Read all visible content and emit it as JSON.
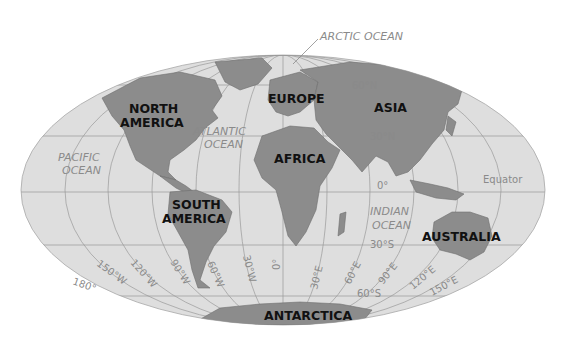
{
  "map": {
    "projection": "Mollweide (elliptical world map)",
    "colors": {
      "ocean": "#dedede",
      "land": "#8c8c8c",
      "border": "#9a9a9a",
      "label": "#111111",
      "secondary_label": "#8a8a8a"
    },
    "continents": [
      {
        "id": "north-america",
        "lines": [
          "NORTH",
          "AMERICA"
        ]
      },
      {
        "id": "south-america",
        "lines": [
          "SOUTH",
          "AMERICA"
        ]
      },
      {
        "id": "europe",
        "lines": [
          "EUROPE"
        ]
      },
      {
        "id": "africa",
        "lines": [
          "AFRICA"
        ]
      },
      {
        "id": "asia",
        "lines": [
          "ASIA"
        ]
      },
      {
        "id": "australia",
        "lines": [
          "AUSTRALIA"
        ]
      },
      {
        "id": "antarctica",
        "lines": [
          "ANTARCTICA"
        ]
      }
    ],
    "oceans": [
      {
        "id": "arctic",
        "lines": [
          "ARCTIC OCEAN"
        ]
      },
      {
        "id": "atlantic",
        "lines": [
          "ATLANTIC",
          "OCEAN"
        ]
      },
      {
        "id": "pacific",
        "lines": [
          "PACIFIC",
          "OCEAN"
        ]
      },
      {
        "id": "indian",
        "lines": [
          "INDIAN",
          "OCEAN"
        ]
      }
    ],
    "latitudes": [
      "60°N",
      "30°N",
      "0°",
      "30°S",
      "60°S"
    ],
    "equator_label": "Equator",
    "longitudes_west": [
      "180°",
      "150°W",
      "120°W",
      "90°W",
      "60°W",
      "30°W"
    ],
    "prime_meridian": "0°",
    "longitudes_east": [
      "30°E",
      "60°E",
      "90°E",
      "120°E",
      "150°E"
    ]
  }
}
